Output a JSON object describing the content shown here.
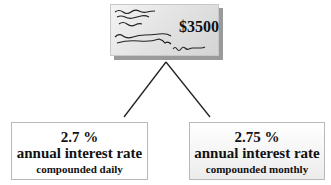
{
  "check": {
    "amount": "$3500",
    "icon": "bank-check-icon"
  },
  "options": [
    {
      "rate": "2.7 %",
      "label": "annual interest rate",
      "compounding": "compounded daily"
    },
    {
      "rate": "2.75 %",
      "label": "annual interest rate",
      "compounding": "compounded monthly"
    }
  ],
  "colors": {
    "check_face": "#e2e2e2",
    "check_shadow": "#9a9a9a",
    "line": "#222222",
    "box_border": "#b8b8b8"
  }
}
